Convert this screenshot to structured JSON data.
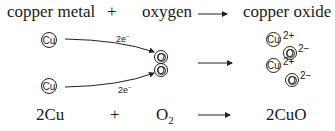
{
  "word_equation": {
    "reactant1": "copper metal",
    "plus": "+",
    "reactant2": "oxygen",
    "product": "copper oxide"
  },
  "diagram": {
    "reactant_atoms": [
      {
        "symbol": "Cu"
      },
      {
        "symbol": "Cu"
      }
    ],
    "oxygen_atoms": [
      {
        "symbol": "O"
      },
      {
        "symbol": "O"
      }
    ],
    "electron_transfers": [
      {
        "label": "2e",
        "superscript": "−"
      },
      {
        "label": "2e",
        "superscript": "−"
      }
    ],
    "product_ions": [
      {
        "symbol": "Cu",
        "charge": "2+"
      },
      {
        "symbol": "O",
        "charge": "2−"
      },
      {
        "symbol": "Cu",
        "charge": "2+"
      },
      {
        "symbol": "O",
        "charge": "2−"
      }
    ]
  },
  "symbol_equation": {
    "reactant1": "2Cu",
    "plus": "+",
    "reactant2": "O",
    "reactant2_subscript": "2",
    "product": "2CuO"
  }
}
